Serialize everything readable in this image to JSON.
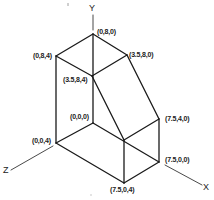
{
  "diagram": {
    "type": "isometric-3d-solid",
    "axes": {
      "x": {
        "label": "X"
      },
      "y": {
        "label": "Y"
      },
      "z": {
        "label": "Z"
      }
    },
    "vertices": [
      {
        "id": "v080",
        "label": "(0,8,0)"
      },
      {
        "id": "v084",
        "label": "(0,8,4)"
      },
      {
        "id": "v3580",
        "label": "(3.5,8,0)"
      },
      {
        "id": "v3584",
        "label": "(3.5,8,4)"
      },
      {
        "id": "v000",
        "label": "(0,0,0)"
      },
      {
        "id": "v004",
        "label": "(0,0,4)"
      },
      {
        "id": "v7540",
        "label": "(7.5,4,0)"
      },
      {
        "id": "v7500",
        "label": "(7.5,0,0)"
      },
      {
        "id": "v7504",
        "label": "(7.5,0,4)"
      }
    ]
  }
}
